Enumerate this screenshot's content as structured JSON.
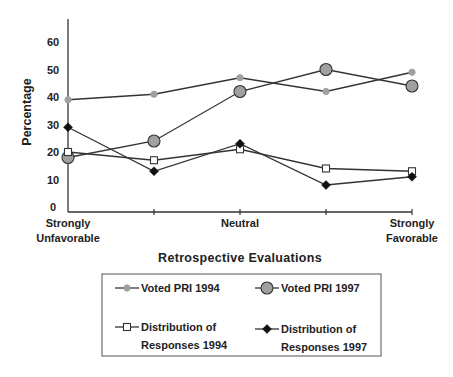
{
  "chart_data": {
    "type": "line",
    "title": "",
    "xlabel": "Retrospective Evaluations",
    "ylabel": "Percentage",
    "ylim": [
      0,
      65
    ],
    "yticks": [
      0,
      10,
      20,
      30,
      40,
      50,
      60
    ],
    "x": [
      1,
      2,
      3,
      4,
      5
    ],
    "xtick_labels": [
      [
        "Strongly",
        "Unfavorable"
      ],
      [
        ""
      ],
      [
        "Neutral"
      ],
      [
        ""
      ],
      [
        "Strongly",
        "Favorable"
      ]
    ],
    "grid": false,
    "legend_position": "bottom",
    "series": [
      {
        "name": "Voted PRI 1994",
        "marker": "small-circle",
        "values": [
          39,
          41,
          47,
          42,
          49
        ]
      },
      {
        "name": "Voted PRI 1997",
        "marker": "large-circle",
        "values": [
          18,
          24,
          42,
          50,
          44
        ]
      },
      {
        "name": "Distribution of Responses 1994",
        "name_lines": [
          "Distribution of",
          "Responses 1994"
        ],
        "marker": "open-square",
        "values": [
          20,
          17,
          21,
          14,
          13
        ]
      },
      {
        "name": "Distribution of Responses 1997",
        "name_lines": [
          "Distribution of",
          "Responses 1997"
        ],
        "marker": "filled-diamond",
        "values": [
          29,
          13,
          23,
          8,
          11
        ]
      }
    ]
  },
  "colors": {
    "line": "#333333",
    "marker_gray": "#a0a0a0",
    "marker_black": "#111111",
    "marker_white": "#ffffff"
  }
}
